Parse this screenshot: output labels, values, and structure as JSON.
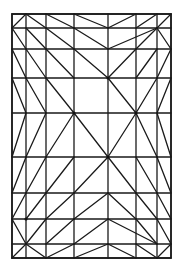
{
  "diagram": {
    "type": "triangulated-rectangle-mesh",
    "stroke_color": "#1a1a1a",
    "background": "#ffffff",
    "frame": {
      "x0": 12,
      "y0": 14,
      "x1": 171,
      "y1": 258
    },
    "columns_x": [
      12,
      26,
      46,
      74,
      108,
      136,
      157,
      171
    ],
    "rows_y": [
      14,
      28,
      49,
      78,
      113,
      157,
      193,
      219,
      244,
      258
    ],
    "diagonals": [
      [
        12,
        28,
        26,
        14
      ],
      [
        26,
        14,
        46,
        28
      ],
      [
        46,
        14,
        74,
        28
      ],
      [
        74,
        14,
        108,
        28
      ],
      [
        108,
        28,
        136,
        14
      ],
      [
        136,
        28,
        157,
        14
      ],
      [
        157,
        28,
        171,
        14
      ],
      [
        12,
        28,
        26,
        49
      ],
      [
        26,
        28,
        46,
        49
      ],
      [
        46,
        28,
        74,
        49
      ],
      [
        74,
        28,
        108,
        49
      ],
      [
        108,
        49,
        157,
        28
      ],
      [
        136,
        49,
        157,
        28
      ],
      [
        157,
        28,
        171,
        49
      ],
      [
        12,
        49,
        26,
        78
      ],
      [
        26,
        49,
        46,
        78
      ],
      [
        46,
        49,
        74,
        78
      ],
      [
        74,
        49,
        108,
        78
      ],
      [
        108,
        78,
        136,
        49
      ],
      [
        136,
        78,
        157,
        49
      ],
      [
        157,
        78,
        171,
        49
      ],
      [
        12,
        78,
        26,
        113
      ],
      [
        26,
        78,
        46,
        113
      ],
      [
        46,
        78,
        74,
        113
      ],
      [
        108,
        78,
        136,
        113
      ],
      [
        136,
        113,
        157,
        78
      ],
      [
        157,
        113,
        171,
        78
      ],
      [
        26,
        113,
        12,
        157
      ],
      [
        46,
        113,
        26,
        157
      ],
      [
        74,
        113,
        46,
        157
      ],
      [
        74,
        113,
        108,
        157
      ],
      [
        136,
        113,
        108,
        157
      ],
      [
        136,
        113,
        157,
        157
      ],
      [
        157,
        113,
        171,
        157
      ],
      [
        26,
        157,
        12,
        193
      ],
      [
        46,
        157,
        26,
        193
      ],
      [
        74,
        157,
        46,
        193
      ],
      [
        108,
        157,
        74,
        193
      ],
      [
        108,
        157,
        136,
        193
      ],
      [
        136,
        157,
        157,
        193
      ],
      [
        157,
        157,
        171,
        193
      ],
      [
        26,
        193,
        12,
        219
      ],
      [
        46,
        193,
        26,
        219
      ],
      [
        74,
        193,
        46,
        219
      ],
      [
        108,
        193,
        74,
        219
      ],
      [
        108,
        193,
        136,
        219
      ],
      [
        136,
        193,
        157,
        219
      ],
      [
        157,
        193,
        171,
        219
      ],
      [
        12,
        219,
        26,
        244
      ],
      [
        46,
        219,
        26,
        244
      ],
      [
        74,
        219,
        46,
        244
      ],
      [
        108,
        219,
        74,
        244
      ],
      [
        108,
        219,
        157,
        244
      ],
      [
        136,
        219,
        157,
        244
      ],
      [
        157,
        219,
        171,
        244
      ],
      [
        26,
        244,
        12,
        258
      ],
      [
        26,
        244,
        46,
        258
      ],
      [
        74,
        244,
        46,
        258
      ],
      [
        108,
        244,
        74,
        258
      ],
      [
        108,
        244,
        136,
        258
      ],
      [
        136,
        244,
        157,
        258
      ],
      [
        171,
        244,
        157,
        258
      ]
    ],
    "nodes": [
      [
        108,
        78
      ],
      [
        74,
        113
      ],
      [
        136,
        113
      ],
      [
        108,
        157
      ],
      [
        26,
        219
      ]
    ]
  }
}
